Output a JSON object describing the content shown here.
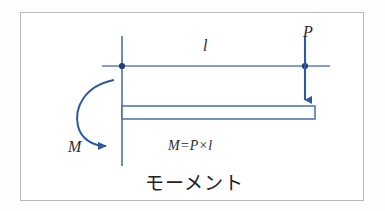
{
  "diagram": {
    "title_caption": "モーメント",
    "formula": "M=P×l",
    "labels": {
      "force": "P",
      "length": "l",
      "moment": "M"
    },
    "colors": {
      "line_blue": "#4a6ea8",
      "arrow_blue": "#2e5aa0",
      "beam_fill": "#ffffff",
      "beam_stroke": "#4a6ea8",
      "frame_border": "#b8b9bb",
      "background": "#ffffff",
      "text": "#2b2b2b"
    },
    "elements": [
      {
        "name": "support-column",
        "type": "vertical-line",
        "x": 122,
        "y1": 36,
        "y2": 166
      },
      {
        "name": "dimension-line",
        "type": "horizontal-line",
        "y": 66,
        "x1": 102,
        "x2": 330
      },
      {
        "name": "node-left",
        "type": "dot",
        "x": 122,
        "y": 66
      },
      {
        "name": "node-right",
        "type": "dot",
        "x": 305,
        "y": 66
      },
      {
        "name": "force-arrow",
        "type": "arrow-down",
        "x": 305,
        "y1": 36,
        "y2": 107
      },
      {
        "name": "beam",
        "type": "rectangle",
        "x": 122,
        "y": 106,
        "width": 193,
        "height": 13
      },
      {
        "name": "moment-arc",
        "type": "curved-arrow-cw",
        "cx": 122,
        "cy": 113,
        "r": 43
      }
    ]
  }
}
